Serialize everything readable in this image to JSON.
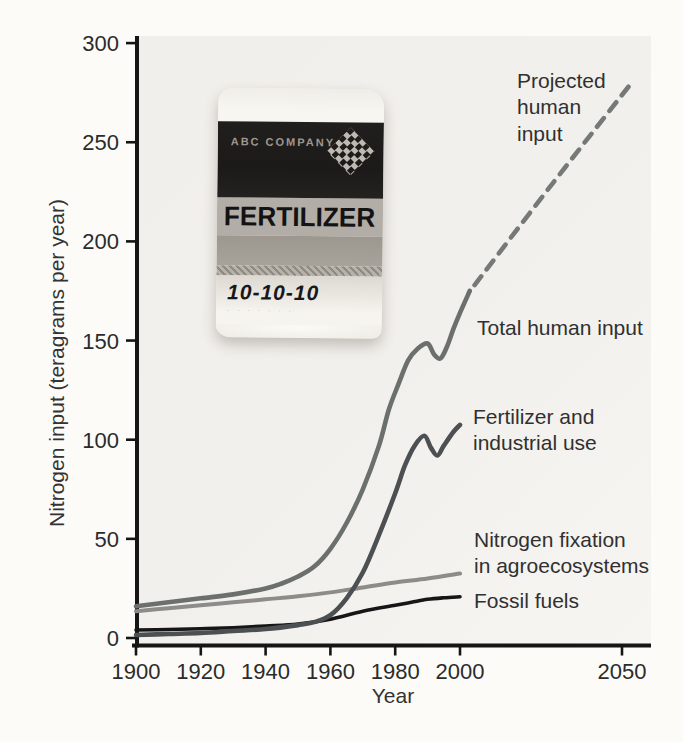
{
  "figure": {
    "y_axis_title": "Nitrogen input (teragrams per year)",
    "x_axis_title": "Year",
    "labels": {
      "projected": "Projected\nhuman\ninput",
      "total": "Total human input",
      "fertilizer": "Fertilizer and\nindustrial use",
      "nitrogen_fixation": "Nitrogen fixation\nin agroecosystems",
      "fossil": "Fossil fuels"
    }
  },
  "bag": {
    "company": "ABC COMPANY",
    "product": "FERTILIZER",
    "grade": "10-10-10",
    "fine_print": "· · · · · · ·"
  },
  "chart_data": {
    "type": "line",
    "title": "",
    "xlabel": "Year",
    "ylabel": "Nitrogen input (teragrams per year)",
    "xlim": [
      1900,
      2055
    ],
    "ylim": [
      0,
      300
    ],
    "x_ticks": [
      1900,
      1920,
      1940,
      1960,
      1980,
      2000,
      2050
    ],
    "y_ticks": [
      0,
      50,
      100,
      150,
      200,
      250,
      300
    ],
    "grid": false,
    "legend_position": "inline-right-labels",
    "plot": {
      "x0": 136,
      "px_per_year": 3.24,
      "y0": 638,
      "px_per_unit": 1.983,
      "x_axis_y": 645.5,
      "y_axis_x": 137,
      "x_axis_start": 132,
      "x_axis_end": 651,
      "y_axis_top": 36,
      "y_axis_bottom": 647.5,
      "axis_color": "#151515",
      "tick_label_color": "#2b2b2b",
      "tick_font_size": 22
    },
    "series": [
      {
        "name": "Nitrogen fixation in agroecosystems",
        "style": "solid",
        "color": "#8d8c88",
        "width": 4,
        "points": [
          [
            1900,
            13.5
          ],
          [
            1910,
            15
          ],
          [
            1920,
            16.5
          ],
          [
            1930,
            18
          ],
          [
            1940,
            19.5
          ],
          [
            1950,
            21
          ],
          [
            1960,
            23
          ],
          [
            1970,
            25.5
          ],
          [
            1980,
            28
          ],
          [
            1990,
            30
          ],
          [
            2000,
            32.5
          ]
        ]
      },
      {
        "name": "Fossil fuels",
        "style": "solid",
        "color": "#161616",
        "width": 3.6,
        "points": [
          [
            1900,
            4
          ],
          [
            1910,
            4.3
          ],
          [
            1920,
            4.7
          ],
          [
            1930,
            5.2
          ],
          [
            1940,
            6
          ],
          [
            1950,
            7
          ],
          [
            1960,
            9.5
          ],
          [
            1970,
            13.5
          ],
          [
            1980,
            16.5
          ],
          [
            1985,
            18
          ],
          [
            1990,
            19.5
          ],
          [
            1995,
            20.3
          ],
          [
            2000,
            20.8
          ]
        ]
      },
      {
        "name": "Fertilizer and industrial use",
        "style": "solid",
        "color": "#4c5052",
        "width": 4.6,
        "points": [
          [
            1900,
            1.5
          ],
          [
            1910,
            2
          ],
          [
            1920,
            2.5
          ],
          [
            1930,
            3.5
          ],
          [
            1940,
            4.5
          ],
          [
            1950,
            6.5
          ],
          [
            1955,
            8
          ],
          [
            1960,
            11.5
          ],
          [
            1965,
            20
          ],
          [
            1970,
            33
          ],
          [
            1975,
            52
          ],
          [
            1980,
            73
          ],
          [
            1983,
            87
          ],
          [
            1986,
            97
          ],
          [
            1989,
            102
          ],
          [
            1991,
            96
          ],
          [
            1993,
            92
          ],
          [
            1995,
            97
          ],
          [
            1998,
            104
          ],
          [
            2000,
            107.5
          ]
        ]
      },
      {
        "name": "Total human input",
        "style": "solid",
        "color": "#6b706d",
        "width": 4.6,
        "points": [
          [
            1900,
            16
          ],
          [
            1910,
            18
          ],
          [
            1920,
            20
          ],
          [
            1930,
            22
          ],
          [
            1940,
            25
          ],
          [
            1945,
            27.5
          ],
          [
            1950,
            31
          ],
          [
            1955,
            36
          ],
          [
            1960,
            45
          ],
          [
            1965,
            58
          ],
          [
            1970,
            75
          ],
          [
            1975,
            97
          ],
          [
            1978,
            115
          ],
          [
            1981,
            128
          ],
          [
            1984,
            140
          ],
          [
            1987,
            146
          ],
          [
            1990,
            148.5
          ],
          [
            1992,
            143
          ],
          [
            1994,
            141
          ],
          [
            1996,
            147
          ],
          [
            1998,
            156
          ],
          [
            2000,
            164
          ],
          [
            2003,
            175
          ]
        ]
      },
      {
        "name": "Projected human input",
        "style": "dashed",
        "color": "#757a77",
        "width": 4.6,
        "points": [
          [
            2004.5,
            178
          ],
          [
            2028,
            228
          ],
          [
            2052,
            278
          ]
        ]
      }
    ]
  }
}
